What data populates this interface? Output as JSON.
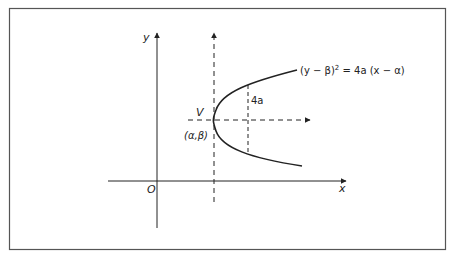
{
  "diagram": {
    "type": "parabola-shifted-vertex",
    "colors": {
      "line": "#222222",
      "frame": "#555555",
      "background": "#ffffff"
    },
    "labels": {
      "y_axis": "y",
      "x_axis": "x",
      "origin": "O",
      "vertex": "V",
      "vertex_coords": "(α,β)",
      "latus_rectum": "4a",
      "equation_lhs": "(y − β)",
      "equation_exp": "2",
      "equation_rhs": " = 4a (x − α)"
    }
  }
}
